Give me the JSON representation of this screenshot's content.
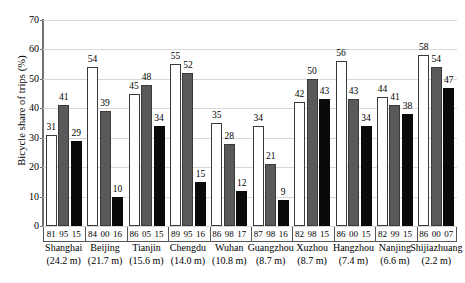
{
  "chart_data": {
    "type": "bar",
    "title": "",
    "xlabel": "",
    "ylabel": "Bicycle share of trips (%)",
    "ylim": [
      0,
      70
    ],
    "yticks": [
      0,
      10,
      20,
      30,
      40,
      50,
      60,
      70
    ],
    "grid": true,
    "legend": "none",
    "categories": [
      "Shanghai",
      "Beijing",
      "Tianjin",
      "Chengdu",
      "Wuhan",
      "Guangzhou",
      "Xuzhou",
      "Hangzhou",
      "Nanjing",
      "Shijiazhuang"
    ],
    "populations": [
      "(24.2 m)",
      "(21.7 m)",
      "(15.6 m)",
      "(14.0 m)",
      "(10.8 m)",
      "(8.7 m)",
      "(8.7 m)",
      "(7.4 m)",
      "(6.6 m)",
      "(2.2 m)"
    ],
    "series": [
      {
        "name": "earliest year",
        "style": "white",
        "years": [
          "81",
          "84",
          "86",
          "89",
          "86",
          "87",
          "82",
          "86",
          "82",
          "86"
        ],
        "values": [
          31,
          54,
          45,
          55,
          35,
          34,
          42,
          56,
          44,
          58
        ]
      },
      {
        "name": "middle year",
        "style": "gray",
        "years": [
          "95",
          "00",
          "05",
          "95",
          "98",
          "98",
          "98",
          "00",
          "99",
          "00"
        ],
        "values": [
          41,
          39,
          48,
          52,
          28,
          21,
          50,
          43,
          41,
          54
        ]
      },
      {
        "name": "latest year",
        "style": "black",
        "years": [
          "15",
          "16",
          "15",
          "16",
          "17",
          "16",
          "15",
          "15",
          "15",
          "07"
        ],
        "values": [
          29,
          10,
          34,
          15,
          12,
          9,
          43,
          34,
          38,
          47
        ]
      }
    ],
    "colors": {
      "white_bar": "#ffffff",
      "gray_bar": "#595959",
      "black_bar": "#0a0a0a",
      "bar_outline": "#3a3a3a",
      "gridline": "#d8d8d8",
      "axis": "#707070",
      "background": "#ffffff",
      "text": "#000000"
    }
  }
}
